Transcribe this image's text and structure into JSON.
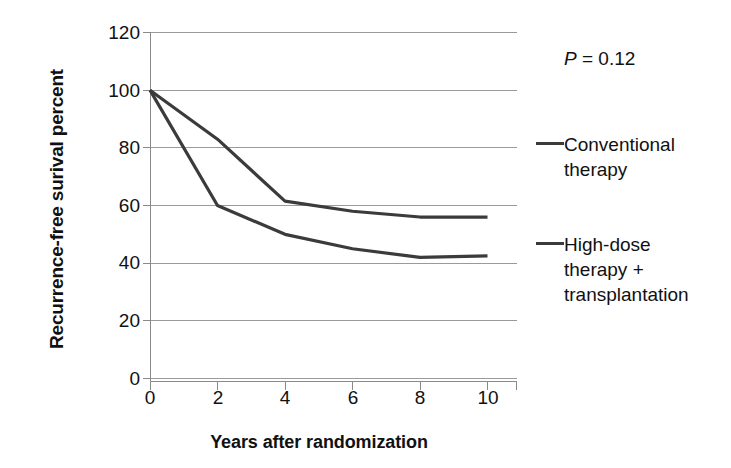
{
  "chart_data": {
    "type": "line",
    "title": "",
    "subtitle": "",
    "xlabel": "Years after randomization",
    "ylabel": "Recurrence-free surival percent",
    "x": [
      0,
      2,
      4,
      6,
      8,
      10
    ],
    "xlim": [
      0,
      10
    ],
    "ylim": [
      0,
      120
    ],
    "xticks": [
      "0",
      "2",
      "4",
      "6",
      "8",
      "10"
    ],
    "yticks": [
      "0",
      "20",
      "40",
      "60",
      "80",
      "100",
      "120"
    ],
    "grid": "horizontal",
    "legend_position": "right",
    "series": [
      {
        "name": "Conventional therapy",
        "color": "#3b3b3b",
        "values": [
          100,
          83,
          61.5,
          58,
          56,
          56
        ]
      },
      {
        "name": "High-dose therapy + transplantation",
        "color": "#3b3b3b",
        "values": [
          100,
          60,
          50,
          45,
          42,
          42.5
        ]
      }
    ],
    "annotations": [
      {
        "name": "p-value",
        "text": "P = 0.12",
        "italic_prefix": "P",
        "rest": " = 0.12"
      }
    ]
  },
  "axes": {
    "y_title": "Recurrence-free surival percent",
    "x_title": "Years after randomization",
    "y_tick_labels": [
      "120",
      "100",
      "80",
      "60",
      "40",
      "20",
      "0"
    ],
    "x_tick_labels": [
      "0",
      "2",
      "4",
      "6",
      "8",
      "10"
    ]
  },
  "legend": {
    "pvalue_italic": "P",
    "pvalue_rest": " = 0.12",
    "entries": [
      {
        "label": "Conventional\ntherapy"
      },
      {
        "label": "High-dose\ntherapy +\ntransplantation"
      }
    ]
  },
  "colors": {
    "line": "#3b3b3b",
    "grid": "#9a9a9a",
    "axis": "#8a8a8a",
    "text": "#111111",
    "background": "#ffffff"
  }
}
